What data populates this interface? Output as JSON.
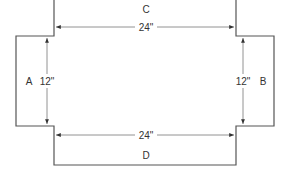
{
  "diagram": {
    "colors": {
      "line": "#555555",
      "text": "#333333",
      "background": "#ffffff"
    },
    "panels": {
      "top": {
        "label": "C"
      },
      "bottom": {
        "label": "D"
      },
      "left": {
        "label": "A"
      },
      "right": {
        "label": "B"
      }
    },
    "dimensions": {
      "top_width": "24\"",
      "bottom_width": "24\"",
      "left_height": "12\"",
      "right_height": "12\""
    }
  }
}
